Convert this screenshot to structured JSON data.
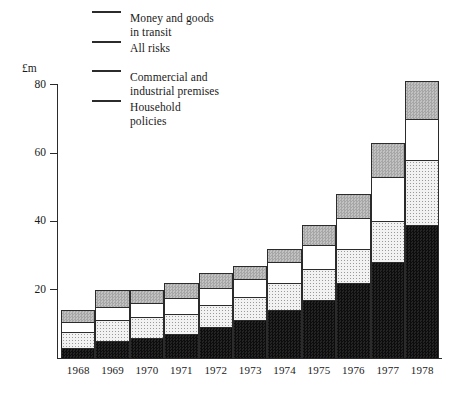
{
  "figure": {
    "y_axis_title": "£m",
    "y_ticks": [
      {
        "value": 80,
        "label": "80"
      },
      {
        "value": 60,
        "label": "60"
      },
      {
        "value": 40,
        "label": "40"
      },
      {
        "value": 20,
        "label": "20"
      }
    ]
  },
  "legend": {
    "items": [
      {
        "key": "money",
        "label": "Money and goods\nin transit",
        "swatch": "money-goods-swatch",
        "color": "#b4b4b4"
      },
      {
        "key": "allrisks",
        "label": "All risks",
        "swatch": "all-risks-swatch",
        "color": "#ffffff"
      },
      {
        "key": "commercial",
        "label": "Commercial and\nindustrial premises",
        "swatch": "commercial-swatch",
        "color": "#f0f0f0"
      },
      {
        "key": "household",
        "label": "Household\npolicies",
        "swatch": "household-swatch",
        "color": "#151515"
      }
    ]
  },
  "chart_data": {
    "type": "bar",
    "stacked": true,
    "title": "",
    "xlabel": "",
    "ylabel": "£m",
    "ylim": [
      0,
      84
    ],
    "grid": false,
    "legend_position": "top-left",
    "categories": [
      "1968",
      "1969",
      "1970",
      "1971",
      "1972",
      "1973",
      "1974",
      "1975",
      "1976",
      "1977",
      "1978"
    ],
    "series": [
      {
        "name": "Household policies",
        "key": "household",
        "color": "#151515",
        "values": [
          3,
          5,
          6,
          7,
          9,
          11,
          14,
          17,
          22,
          28,
          39
        ]
      },
      {
        "name": "Commercial and industrial premises",
        "key": "commercial",
        "color": "#f0f0f0",
        "values": [
          4.5,
          6,
          6,
          6,
          6.5,
          7,
          8,
          9,
          10,
          12,
          19
        ]
      },
      {
        "name": "All risks",
        "key": "allrisks",
        "color": "#ffffff",
        "values": [
          3,
          4,
          4,
          4.5,
          5,
          5,
          6,
          7,
          9,
          13,
          12
        ]
      },
      {
        "name": "Money and goods in transit",
        "key": "money",
        "color": "#b4b4b4",
        "values": [
          3.5,
          5,
          4,
          4.5,
          4.5,
          4,
          4,
          6,
          7,
          10,
          11
        ]
      }
    ],
    "totals": [
      14,
      20,
      20,
      22,
      25,
      27,
      32,
      39,
      48,
      63,
      81
    ]
  }
}
